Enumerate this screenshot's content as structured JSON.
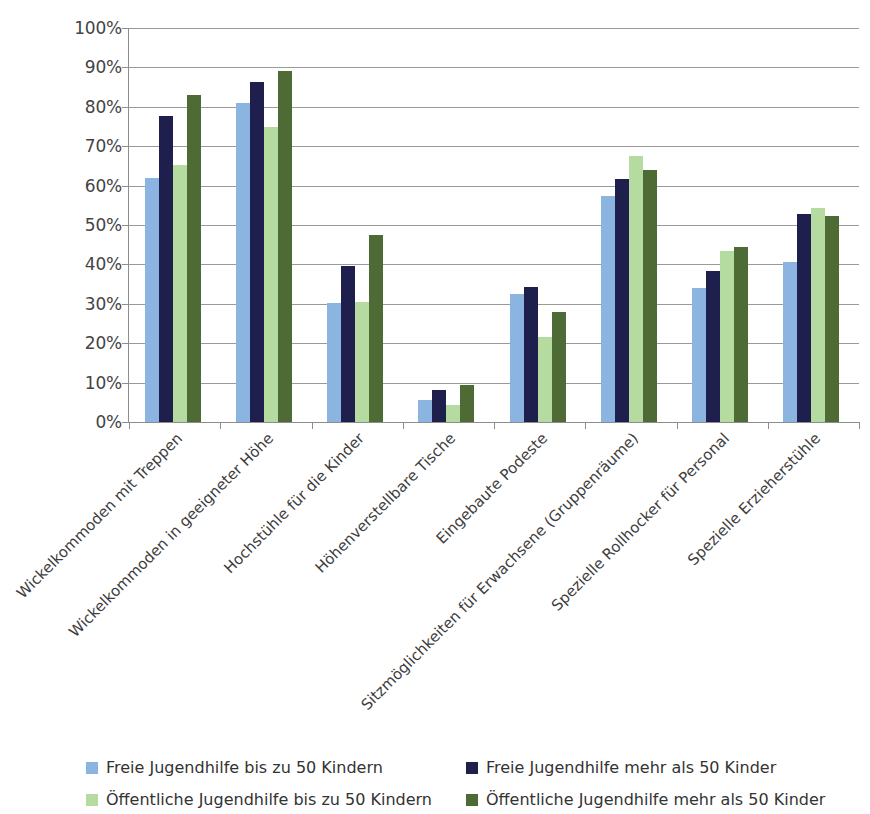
{
  "chart_data": {
    "type": "bar",
    "title": "",
    "subtitle": "",
    "xlabel": "",
    "ylabel": "",
    "ylim": [
      0,
      100
    ],
    "grid": true,
    "legend_position": "bottom",
    "value_suffix": "%",
    "categories": [
      "Wickelkommoden mit Treppen",
      "Wickelkommoden in geeigneter Höhe",
      "Hochstühle für die Kinder",
      "Höhenverstellbare Tische",
      "Eingebaute Podeste",
      "Sitzmöglichkeiten für Erwachsene (Gruppenräume)",
      "Spezielle Rollhocker für Personal",
      "Spezielle Erzieherstühle"
    ],
    "series": [
      {
        "name": "Freie Jugendhilfe bis zu 50 Kindern",
        "color": "#8cb4e0",
        "values": [
          62.0,
          81.0,
          30.2,
          5.7,
          32.4,
          57.4,
          34.0,
          40.5
        ]
      },
      {
        "name": "Freie Jugendhilfe mehr als 50 Kinder",
        "color": "#1f1f4e",
        "values": [
          77.6,
          86.2,
          39.6,
          8.0,
          34.3,
          61.8,
          38.3,
          52.8
        ]
      },
      {
        "name": "Öffentliche Jugendhilfe bis zu 50 Kindern",
        "color": "#b5dba0",
        "values": [
          65.2,
          74.8,
          30.4,
          4.4,
          21.6,
          67.4,
          43.5,
          54.3
        ]
      },
      {
        "name": "Öffentliche Jugendhilfe mehr als 50 Kinder",
        "color": "#4e6b35",
        "values": [
          83.0,
          89.0,
          47.5,
          9.4,
          27.9,
          64.0,
          44.3,
          52.3
        ]
      }
    ],
    "y_ticks": [
      "0%",
      "10%",
      "20%",
      "30%",
      "40%",
      "50%",
      "60%",
      "70%",
      "80%",
      "90%",
      "100%"
    ],
    "y_tick_values": [
      0,
      10,
      20,
      30,
      40,
      50,
      60,
      70,
      80,
      90,
      100
    ]
  },
  "legend": {
    "entries": [
      "Freie Jugendhilfe bis zu 50 Kindern",
      "Freie Jugendhilfe mehr als 50 Kinder",
      "Öffentliche Jugendhilfe bis zu 50 Kindern",
      "Öffentliche Jugendhilfe mehr als 50 Kinder"
    ]
  }
}
